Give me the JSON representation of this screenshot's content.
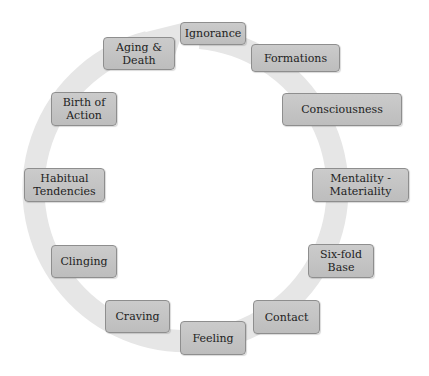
{
  "diagram": {
    "type": "cycle",
    "ring_color": "#e6e6e6",
    "node_fill": "#c4c4c4",
    "node_border": "#8e8e8e",
    "direction": "clockwise",
    "nodes": [
      {
        "id": "ignorance",
        "label": "Ignorance"
      },
      {
        "id": "formations",
        "label": "Formations"
      },
      {
        "id": "consciousness",
        "label": "Consciousness"
      },
      {
        "id": "mentality-materiality",
        "label": "Mentality - Materiality"
      },
      {
        "id": "six-fold-base",
        "label": "Six-fold Base"
      },
      {
        "id": "contact",
        "label": "Contact"
      },
      {
        "id": "feeling",
        "label": "Feeling"
      },
      {
        "id": "craving",
        "label": "Craving"
      },
      {
        "id": "clinging",
        "label": "Clinging"
      },
      {
        "id": "habitual-tendencies",
        "label": "Habitual Tendencies"
      },
      {
        "id": "birth-of-action",
        "label": "Birth of Action"
      },
      {
        "id": "aging-death",
        "label": "Aging & Death"
      }
    ]
  }
}
